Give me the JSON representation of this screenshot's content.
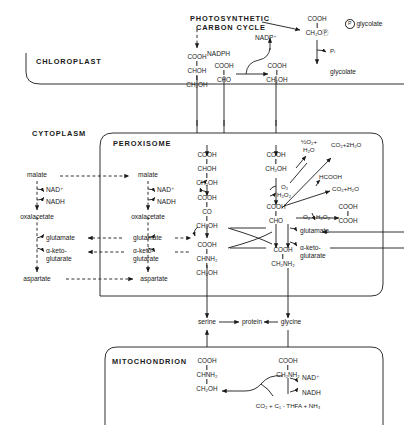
{
  "figure": {
    "title_text": "Photorespiration / glycolate pathway across chloroplast, peroxisome and mitochondrion",
    "compartments": [
      {
        "id": "chloroplast",
        "label": "CHLOROPLAST"
      },
      {
        "id": "cytoplasm",
        "label": "CYTOPLASM"
      },
      {
        "id": "peroxisome",
        "label": "PEROXISOME"
      },
      {
        "id": "mitochondrion",
        "label": "MITOCHONDRION"
      }
    ]
  },
  "chloroplast": {
    "cycle_line1": "PHOTOSYNTHETIC",
    "cycle_line2": "CARBON CYCLE",
    "phosphoglycolate": [
      "COOH",
      "CH₂OⓅ"
    ],
    "p_glycolate_label": "glycolate",
    "p_circle": "P",
    "glycerate": [
      "COOH",
      "CHOH",
      "CH₂OH"
    ],
    "glyoxylate": [
      "COOH",
      "CHO"
    ],
    "glycolate": [
      "COOH",
      "CH₂OH"
    ],
    "glycolate_label": "glycolate",
    "nadp_ox": "NADP⁺",
    "nadph": "NADPH",
    "pi": "Pᵢ"
  },
  "cytoplasm": {
    "malate": "malate",
    "oxalacetate": "oxalacetate",
    "glutamate": "glutamate",
    "aketo_line1": "α-keto-",
    "aketo_line2": "glutarate",
    "aspartate": "aspartate",
    "nad_ox": "NAD⁺",
    "nadh": "NADH"
  },
  "peroxisome": {
    "malate": "malate",
    "oxalacetate": "oxalacetate",
    "glutamate": "glutamate",
    "aketo_line1": "α-keto-",
    "aketo_line2": "glutarate",
    "aspartate": "aspartate",
    "nad_ox": "NAD⁺",
    "nadh": "NADH",
    "glycerate": [
      "COOH",
      "CHOH",
      "CH₂OH"
    ],
    "hydroxypyruvate": [
      "COOH",
      "CO",
      "CH₂OH"
    ],
    "serine": [
      "COOH",
      "CHNH₂",
      "CH₂OH"
    ],
    "glycolate": [
      "COOH",
      "CH₂OH"
    ],
    "glyoxylate": [
      "COOH",
      "CHO"
    ],
    "glycine": [
      "COOH",
      "CH₂NH₂"
    ],
    "oxalate": [
      "COOH",
      "COOH"
    ],
    "o2_in": "O₂",
    "h2o2_out": "H₂O₂",
    "half_o2_h2o_l1": "½O₂+",
    "half_o2_h2o_l2": "H₂O",
    "co2_2h2o": "CO₂+2H₂O",
    "hcooh": "HCOOH",
    "co2_h2o": "CO₂+H₂O",
    "o2_lower": "O₂",
    "h2o2_lower": "H₂O₂",
    "glutamate_right": "glutamate",
    "aketo_right_l1": "α-keto-",
    "aketo_right_l2": "glutarate"
  },
  "between": {
    "serine": "serine",
    "protein": "protein",
    "glycine": "glycine"
  },
  "mitochondrion": {
    "serine": [
      "COOH",
      "CHNH₂",
      "CH₂OH"
    ],
    "glycine": [
      "COOH",
      "CH₂NH₂"
    ],
    "nad_ox": "NAD⁺",
    "nadh": "NADH",
    "products": "CO₂ + C₁ - THFA + NH₃"
  },
  "style": {
    "ink": "#1a1a1a",
    "paper": "#ffffff"
  }
}
